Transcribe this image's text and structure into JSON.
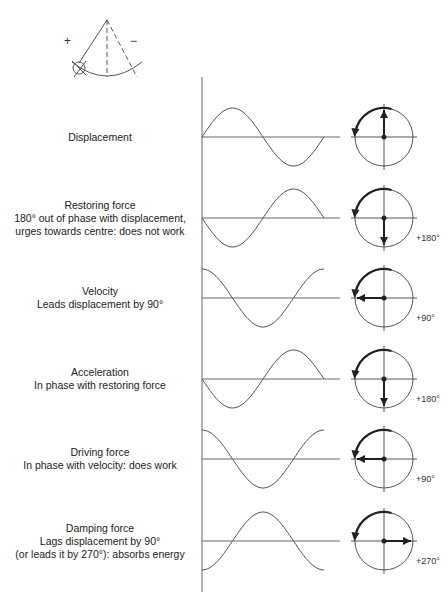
{
  "pendulum": {
    "plus_label": "+",
    "minus_label": "−"
  },
  "rows": [
    {
      "title": "Displacement",
      "lines": [],
      "phase_label": "",
      "wave_phase_deg": 0,
      "phasor_angle_deg": 90
    },
    {
      "title": "Restoring force",
      "lines": [
        "180° out of phase with displacement,",
        "urges towards centre: does not work"
      ],
      "phase_label": "+180°",
      "wave_phase_deg": 180,
      "phasor_angle_deg": 270
    },
    {
      "title": "Velocity",
      "lines": [
        "Leads displacement by 90°"
      ],
      "phase_label": "+90°",
      "wave_phase_deg": 90,
      "phasor_angle_deg": 180
    },
    {
      "title": "Acceleration",
      "lines": [
        "In phase with restoring force"
      ],
      "phase_label": "+180°",
      "wave_phase_deg": 180,
      "phasor_angle_deg": 270
    },
    {
      "title": "Driving force",
      "lines": [
        "In phase with velocity: does work"
      ],
      "phase_label": "+90°",
      "wave_phase_deg": 90,
      "phasor_angle_deg": 180
    },
    {
      "title": "Damping force",
      "lines": [
        "Lags displacement by 90°",
        "(or leads it by 270°): absorbs energy"
      ],
      "phase_label": "+270°",
      "wave_phase_deg": 270,
      "phasor_angle_deg": 0
    }
  ],
  "colors": {
    "line": "#555555",
    "arrow": "#222222"
  }
}
